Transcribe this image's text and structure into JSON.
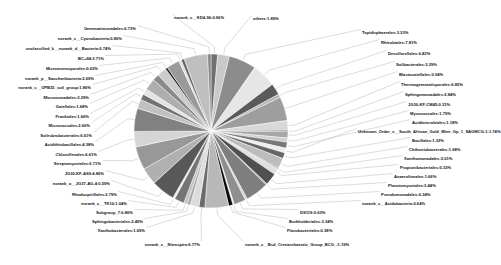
{
  "chart_data": {
    "type": "pie",
    "title": "",
    "subtitle": "",
    "xlabel": "",
    "ylabel": "",
    "legend_position": "none",
    "grid": false,
    "value_unit": "%",
    "center": {
      "x": 211,
      "y": 131
    },
    "radius": 77,
    "start_angle_deg": -90,
    "categories": [
      "others",
      "Tepidisphaerales",
      "Rhizobiales",
      "Desulfurellales",
      "Solibacterales",
      "Blastocatellales",
      "Thermogemmatisporales",
      "Sphingomonadales",
      "JG30-KF-CM45",
      "Myxococcales",
      "Acidimicrobiales",
      "Unknown_Order_c__South_African_Gold_Mine_Gp_1_SAGMCG-1",
      "Bacillales",
      "Chthoniobacterales",
      "Xanthomonadales",
      "Propionibacteriales",
      "Anaerolineales",
      "Planctomycetales",
      "Pseudomonadales",
      "norank_c__Acidobacteria",
      "DS119",
      "Burkholderiales",
      "Flavobacteriales",
      "norank_c__Bsd_Crenarchaeotic_Group_BCG_",
      "norank_c__Nitrospira",
      "Xanthobacterales",
      "Sphingobacteriales",
      "Subgroup_7",
      "norank_c__TK10",
      "Rhodospirillales",
      "norank_o__JG37-AG-4",
      "Streptomycetales",
      "JG30-KF-AS9",
      "Chloroflexales",
      "Acidithiobacillales",
      "Solirubrobacterales",
      "Micrococcales",
      "Frankiales",
      "Gaiellales",
      "Micromonadales",
      "norank_c__OPB35_soil_group",
      "norank_p__Saccharibacteria",
      "Micromonosporales",
      "BC+84",
      "unclassified_k__norank_d__Bacteria",
      "norank_c__Cyanobacteria",
      "Gemmatimonadales",
      "norank_c__KD4-96"
    ],
    "values": [
      1.89,
      3.33,
      7.81,
      6.83,
      3.29,
      0.94,
      6.85,
      2.84,
      0.31,
      1.79,
      1.18,
      1.74,
      1.32,
      1.68,
      3.01,
      0.33,
      1.66,
      3.44,
      0.34,
      6.64,
      0.63,
      3.34,
      0.38,
      1.19,
      6.77,
      1.69,
      2.49,
      0.86,
      1.04,
      2.79,
      0.59,
      6.71,
      4.86,
      6.61,
      4.38,
      6.61,
      2.6,
      1.66,
      1.68,
      3.29,
      1.86,
      2.69,
      0.63,
      3.71,
      0.74,
      0.86,
      6.73,
      0.96
    ],
    "labels": [
      {
        "id": "norank_c__KD4-96",
        "text": "norank_c__KD4-96:0.96%",
        "x": 174,
        "y": 16,
        "align": "r"
      },
      {
        "id": "others",
        "text": "others:1.89%",
        "x": 253,
        "y": 17,
        "align": "r"
      },
      {
        "id": "Tepidisphaerales",
        "text": "Tepidisphaerales:3.33%",
        "x": 362,
        "y": 31,
        "align": "r"
      },
      {
        "id": "Rhizobiales",
        "text": "Rhizobiales:7.81%",
        "x": 381,
        "y": 41,
        "align": "r"
      },
      {
        "id": "Desulfurellales",
        "text": "Desulfurellales:6.83%",
        "x": 388,
        "y": 52,
        "align": "r"
      },
      {
        "id": "Solibacterales",
        "text": "Solibacterales:3.29%",
        "x": 396,
        "y": 63,
        "align": "r"
      },
      {
        "id": "Blastocatellales",
        "text": "Blastocatellales:0.94%",
        "x": 399,
        "y": 73,
        "align": "r"
      },
      {
        "id": "Thermogemmatisporales",
        "text": "Thermogemmatisporales:6.85%",
        "x": 401,
        "y": 83,
        "align": "r"
      },
      {
        "id": "Sphingomonadales",
        "text": "Sphingomonadales:2.84%",
        "x": 405,
        "y": 93,
        "align": "r"
      },
      {
        "id": "JG30-KF-CM45",
        "text": "JG30-KF-CM45:0.31%",
        "x": 408,
        "y": 103,
        "align": "r"
      },
      {
        "id": "Myxococcales",
        "text": "Myxococcales:1.79%",
        "x": 410,
        "y": 112,
        "align": "r"
      },
      {
        "id": "Acidimicrobiales",
        "text": "Acidimicrobiales:1.18%",
        "x": 412,
        "y": 121,
        "align": "r"
      },
      {
        "id": "SAGMCG-1",
        "text": "Unknown_Order_c__South_African_Gold_Mine_Gp_1_SAGMCG-1:1.74%",
        "x": 358,
        "y": 130,
        "align": "r"
      },
      {
        "id": "Bacillales",
        "text": "Bacillales:1.32%",
        "x": 412,
        "y": 139,
        "align": "r"
      },
      {
        "id": "Chthoniobacterales",
        "text": "Chthoniobacterales:1.68%",
        "x": 409,
        "y": 148,
        "align": "r"
      },
      {
        "id": "Xanthomonadales",
        "text": "Xanthomonadales:3.01%",
        "x": 404,
        "y": 157,
        "align": "r"
      },
      {
        "id": "Propionibacteriales",
        "text": "Propionibacteriales:0.33%",
        "x": 400,
        "y": 166,
        "align": "r"
      },
      {
        "id": "Anaerolineales",
        "text": "Anaerolineales:1.66%",
        "x": 394,
        "y": 175,
        "align": "r"
      },
      {
        "id": "Planctomycetales",
        "text": "Planctomycetales:3.44%",
        "x": 388,
        "y": 184,
        "align": "r"
      },
      {
        "id": "Pseudomonadales",
        "text": "Pseudomonadales:0.34%",
        "x": 381,
        "y": 193,
        "align": "r"
      },
      {
        "id": "norank_c__Acidobacteria",
        "text": "norank_c__Acidobacteria:6.64%",
        "x": 362,
        "y": 202,
        "align": "r"
      },
      {
        "id": "DS119",
        "text": "DS119:0.63%",
        "x": 300,
        "y": 211,
        "align": "r"
      },
      {
        "id": "Burkholderiales",
        "text": "Burkholderiales:3.34%",
        "x": 289,
        "y": 220,
        "align": "r"
      },
      {
        "id": "Flavobacteriales",
        "text": "Flavobacteriales:0.38%",
        "x": 287,
        "y": 229,
        "align": "r"
      },
      {
        "id": "BCG",
        "text": "norank_c__Bsd_Crenarchaeotic_Group_BCG_:1.19%",
        "x": 245,
        "y": 243,
        "align": "r"
      },
      {
        "id": "norank_c__Nitrospira",
        "text": "norank_c__Nitrospira:6.77%",
        "x": 200,
        "y": 243,
        "align": "l"
      },
      {
        "id": "Xanthobacterales",
        "text": "Xanthobacterales:1.69%",
        "x": 145,
        "y": 229,
        "align": "l"
      },
      {
        "id": "Sphingobacteriales",
        "text": "Sphingobacteriales:2.49%",
        "x": 143,
        "y": 220,
        "align": "l"
      },
      {
        "id": "Subgroup_7",
        "text": "Subgroup_7:0.86%",
        "x": 133,
        "y": 211,
        "align": "l"
      },
      {
        "id": "norank_c__TK10",
        "text": "norank_c__TK10:1.04%",
        "x": 127,
        "y": 202,
        "align": "l"
      },
      {
        "id": "Rhodospirillales",
        "text": "Rhodospirillales:2.79%",
        "x": 117,
        "y": 193,
        "align": "l"
      },
      {
        "id": "norank_o__JG37-AG-4",
        "text": "norank_o__JG37-AG-4:0.59%",
        "x": 110,
        "y": 182,
        "align": "l"
      },
      {
        "id": "Streptomycetales",
        "text": "JG30-KF-AS9:4.86%",
        "x": 104,
        "y": 172,
        "align": "l"
      },
      {
        "id": "JG30-KF-AS9",
        "text": "Streptomycetales:6.71%",
        "x": 101,
        "y": 162,
        "align": "l"
      },
      {
        "id": "Chloroflexales",
        "text": "Chloroflexales:6.61%",
        "x": 97,
        "y": 153,
        "align": "l"
      },
      {
        "id": "Acidithiobacillales",
        "text": "Acidithiobacillales:4.38%",
        "x": 94,
        "y": 143,
        "align": "l"
      },
      {
        "id": "Solirubrobacterales",
        "text": "Solirubrobacterales:6.61%",
        "x": 92,
        "y": 134,
        "align": "l"
      },
      {
        "id": "Micrococcales",
        "text": "Micrococcales:2.60%",
        "x": 90,
        "y": 124,
        "align": "l"
      },
      {
        "id": "Frankiales",
        "text": "Frankiales:1.66%",
        "x": 89,
        "y": 115,
        "align": "l"
      },
      {
        "id": "Gaiellales",
        "text": "Gaiellales:1.68%",
        "x": 88,
        "y": 105,
        "align": "l"
      },
      {
        "id": "Micromonadales",
        "text": "Micromonadales:3.29%",
        "x": 89,
        "y": 96,
        "align": "l"
      },
      {
        "id": "norank_c__OPB35_soil_group",
        "text": "norank_c__OPB35_soil_group:1.86%",
        "x": 91,
        "y": 86,
        "align": "l"
      },
      {
        "id": "norank_p__Saccharibacteria",
        "text": "norank_p__Saccharibacteria:2.69%",
        "x": 94,
        "y": 77,
        "align": "l"
      },
      {
        "id": "Micromonosporales",
        "text": "Micromonosporales:0.63%",
        "x": 98,
        "y": 67,
        "align": "l"
      },
      {
        "id": "BC+84",
        "text": "BC+84:3.71%",
        "x": 104,
        "y": 57,
        "align": "l"
      },
      {
        "id": "unclassified_Bacteria",
        "text": "unclassified_k__norank_d__Bacteria:0.74%",
        "x": 111,
        "y": 47,
        "align": "l"
      },
      {
        "id": "norank_c__Cyanobacteria",
        "text": "norank_c__Cyanobacteria:0.86%",
        "x": 122,
        "y": 37,
        "align": "l"
      },
      {
        "id": "Gemmatimonadales",
        "text": "Gemmatimonadales:6.73%",
        "x": 136,
        "y": 27,
        "align": "l"
      }
    ],
    "slice_colors": [
      "#6f6f6f",
      "#c9c9c9",
      "#8c8c8c",
      "#e6e6e6",
      "#5a5a5a",
      "#b4b4b4",
      "#9e9e9e",
      "#d8d8d8",
      "#2b2b2b",
      "#a6a6a6",
      "#cfcfcf",
      "#787878",
      "#ededed",
      "#666666",
      "#bcbcbc",
      "#949494",
      "#e0e0e0",
      "#505050",
      "#ababab",
      "#7f7f7f",
      "#d2d2d2",
      "#8f8f8f",
      "#f2f2f2",
      "#0a0a0a",
      "#b8b8b8",
      "#6b6b6b",
      "#dcdcdc",
      "#a2a2a2",
      "#c4c4c4",
      "#757575",
      "#e9e9e9",
      "#585858",
      "#b0b0b0",
      "#989898",
      "#d5d5d5",
      "#818181",
      "#c0c0c0",
      "#727272",
      "#e3e3e3",
      "#aeaeae",
      "#8a8a8a",
      "#cccccc",
      "#1a1a1a",
      "#9a9a9a",
      "#dedede",
      "#636363",
      "#bfbfbf",
      "#868686"
    ]
  }
}
